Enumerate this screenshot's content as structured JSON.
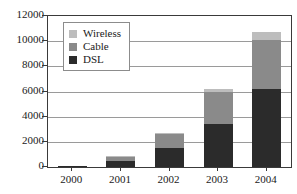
{
  "chart_data": {
    "type": "bar",
    "subtype": "stacked-bar",
    "title": "",
    "xlabel": "",
    "ylabel": "",
    "ylim": [
      0,
      12000
    ],
    "ytick_step": 2000,
    "ytick_labels": [
      "0",
      "2000",
      "4000",
      "6000",
      "8000",
      "10000",
      "12000"
    ],
    "ytick_values": [
      0,
      2000,
      4000,
      6000,
      8000,
      10000,
      12000
    ],
    "grid": true,
    "grid_axis": "y",
    "legend_position": "upper-left-inside",
    "categories": [
      "2000",
      "2001",
      "2002",
      "2003",
      "2004"
    ],
    "series": [
      {
        "name": "DSL",
        "color": "#2b2b2b",
        "values": [
          60,
          500,
          1500,
          3400,
          6200
        ]
      },
      {
        "name": "Cable",
        "color": "#8a8a8a",
        "values": [
          40,
          330,
          1150,
          2600,
          3900
        ]
      },
      {
        "name": "Wireless",
        "color": "#bdbdbd",
        "values": [
          10,
          50,
          50,
          200,
          600
        ]
      }
    ],
    "stack_order_bottom_to_top": [
      "DSL",
      "Cable",
      "Wireless"
    ],
    "totals": [
      110,
      880,
      2700,
      6200,
      10700
    ]
  },
  "legend": {
    "entries": [
      {
        "label": "Wireless",
        "color": "#bdbdbd"
      },
      {
        "label": "Cable",
        "color": "#8a8a8a"
      },
      {
        "label": "DSL",
        "color": "#2b2b2b"
      }
    ]
  },
  "colors": {
    "axis": "#3a3a3a",
    "gridline": "#9a9a9a",
    "background": "#ffffff",
    "legend_border": "#8c8c8c",
    "text": "#1a1a1a"
  }
}
